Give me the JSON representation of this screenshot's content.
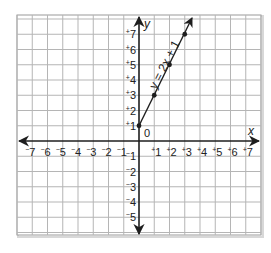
{
  "chart_data": {
    "type": "line",
    "title": "",
    "xlabel": "x",
    "ylabel": "y",
    "xlim": [
      -8,
      8
    ],
    "ylim": [
      -6,
      8
    ],
    "grid": true,
    "origin_label": "0",
    "x_ticks": [
      {
        "value": -7,
        "label": "-7"
      },
      {
        "value": -6,
        "label": "-6"
      },
      {
        "value": -5,
        "label": "-5"
      },
      {
        "value": -4,
        "label": "-4"
      },
      {
        "value": -3,
        "label": "-3"
      },
      {
        "value": -2,
        "label": "-2"
      },
      {
        "value": -1,
        "label": "-1"
      },
      {
        "value": 1,
        "label": "+1"
      },
      {
        "value": 2,
        "label": "+2"
      },
      {
        "value": 3,
        "label": "+3"
      },
      {
        "value": 4,
        "label": "+4"
      },
      {
        "value": 5,
        "label": "+5"
      },
      {
        "value": 6,
        "label": "+6"
      },
      {
        "value": 7,
        "label": "+7"
      }
    ],
    "y_ticks": [
      {
        "value": 7,
        "label": "+7"
      },
      {
        "value": 6,
        "label": "+6"
      },
      {
        "value": 5,
        "label": "+5"
      },
      {
        "value": 4,
        "label": "+4"
      },
      {
        "value": 3,
        "label": "+3"
      },
      {
        "value": 2,
        "label": "+2"
      },
      {
        "value": 1,
        "label": "+1"
      },
      {
        "value": -1,
        "label": "-1"
      },
      {
        "value": -2,
        "label": "-2"
      },
      {
        "value": -3,
        "label": "-3"
      },
      {
        "value": -4,
        "label": "-4"
      },
      {
        "value": -5,
        "label": "-5"
      }
    ],
    "series": [
      {
        "name": "y = 2x + 1",
        "x": [
          0,
          1,
          2,
          3
        ],
        "y": [
          1,
          3,
          5,
          7
        ],
        "markers": true,
        "arrow_end": true
      }
    ],
    "annotations": [
      {
        "text": "y = 2x + 1",
        "rotation_deg": -63,
        "anchor": "along line"
      }
    ]
  },
  "colors": {
    "grid": "#b5b5b5",
    "axes": "#1e1e1e",
    "line": "#1e1e1e",
    "frame": "#9a9a9a"
  }
}
